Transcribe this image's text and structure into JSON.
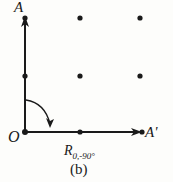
{
  "figure": {
    "caption": "(b)",
    "transform_label_main": "R",
    "transform_label_sub": "0,-90°",
    "points": {
      "A": "A",
      "O": "O",
      "A_prime": "A'"
    }
  },
  "colors": {
    "ink": "#1a1a1a",
    "background": "#fdfdfb"
  },
  "grid": {
    "rows": 3,
    "cols": 3
  }
}
